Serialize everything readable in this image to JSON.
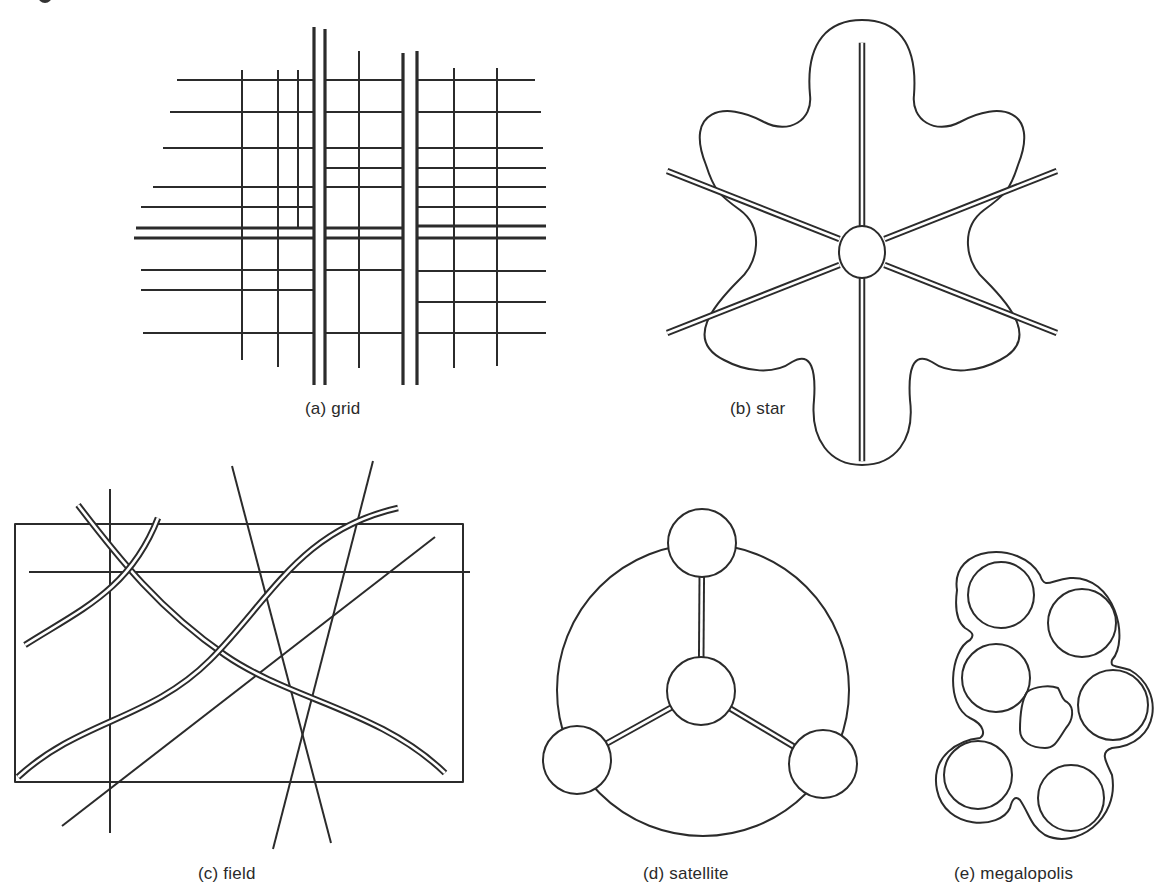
{
  "figure": {
    "header_cropped": true,
    "panels": [
      {
        "id": "a",
        "label": "(a) grid",
        "kind": "grid"
      },
      {
        "id": "b",
        "label": "(b) star",
        "kind": "star"
      },
      {
        "id": "c",
        "label": "(c) field",
        "kind": "field"
      },
      {
        "id": "d",
        "label": "(d) satellite",
        "kind": "satellite"
      },
      {
        "id": "e",
        "label": "(e) megalopolis",
        "kind": "megalopolis"
      }
    ],
    "colors": {
      "ink": "#2b2b2b",
      "background": "#ffffff"
    }
  },
  "grid": {
    "main_verticals": [
      [
        314,
        27,
        385
      ],
      [
        325,
        29,
        385
      ],
      [
        403,
        53,
        385
      ],
      [
        417,
        51,
        385
      ]
    ],
    "main_horizontals": [
      [
        136,
        228,
        314
      ],
      [
        325,
        228,
        403
      ],
      [
        417,
        226,
        546
      ],
      [
        134,
        238,
        314
      ],
      [
        325,
        238,
        403
      ],
      [
        417,
        238,
        546
      ]
    ],
    "minor_verticals": [
      [
        242,
        70,
        360
      ],
      [
        278,
        70,
        367
      ],
      [
        298,
        70,
        228
      ],
      [
        359,
        51,
        368
      ],
      [
        454,
        68,
        368
      ],
      [
        497,
        68,
        366
      ]
    ],
    "minor_horizontals": [
      [
        177,
        80,
        314
      ],
      [
        170,
        112,
        314
      ],
      [
        163,
        148,
        314
      ],
      [
        153,
        187,
        314
      ],
      [
        141,
        207,
        314
      ],
      [
        325,
        80,
        403
      ],
      [
        325,
        112,
        403
      ],
      [
        325,
        148,
        403
      ],
      [
        325,
        168,
        403
      ],
      [
        325,
        187,
        403
      ],
      [
        417,
        80,
        535
      ],
      [
        417,
        112,
        541
      ],
      [
        417,
        148,
        543
      ],
      [
        417,
        168,
        546
      ],
      [
        417,
        187,
        546
      ],
      [
        417,
        207,
        546
      ],
      [
        141,
        270,
        314
      ],
      [
        141,
        290,
        314
      ],
      [
        143,
        333,
        314
      ],
      [
        325,
        270,
        403
      ],
      [
        325,
        333,
        403
      ],
      [
        417,
        271,
        546
      ],
      [
        417,
        302,
        546
      ],
      [
        417,
        333,
        546
      ]
    ]
  },
  "star": {
    "center": [
      862,
      252
    ],
    "hub_rx": 23,
    "hub_ry": 26,
    "spoke_angles_deg": [
      -90,
      -30,
      30,
      90,
      150,
      210
    ],
    "spoke_length": 225
  },
  "field": {
    "rect": [
      15,
      524,
      463,
      782
    ],
    "lines": [
      [
        29,
        572,
        470,
        572
      ],
      [
        110,
        489,
        110,
        833
      ],
      [
        232,
        466,
        331,
        843
      ],
      [
        373,
        461,
        273,
        849
      ],
      [
        62,
        826,
        435,
        537
      ]
    ]
  },
  "satellite": {
    "ring": {
      "cx": 703,
      "cy": 690,
      "r": 146
    },
    "towns": [
      {
        "cx": 702,
        "cy": 543,
        "r": 34
      },
      {
        "cx": 701,
        "cy": 691,
        "r": 34
      },
      {
        "cx": 577,
        "cy": 760,
        "r": 34
      },
      {
        "cx": 823,
        "cy": 764,
        "r": 34
      }
    ]
  },
  "megalopolis": {
    "cities": [
      {
        "cx": 1001,
        "cy": 595,
        "r": 33
      },
      {
        "cx": 1082,
        "cy": 623,
        "r": 34
      },
      {
        "cx": 996,
        "cy": 678,
        "r": 34
      },
      {
        "cx": 1113,
        "cy": 705,
        "r": 35
      },
      {
        "cx": 978,
        "cy": 775,
        "r": 34
      },
      {
        "cx": 1071,
        "cy": 798,
        "r": 33
      }
    ]
  }
}
